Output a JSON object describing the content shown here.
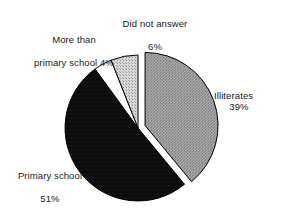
{
  "chart_data": {
    "type": "pie",
    "title": "",
    "subtitle": "",
    "xlabel": "",
    "ylabel": "",
    "legend_position": "none",
    "grid": false,
    "value_suffix": "%",
    "categories": [
      "Illiterates",
      "Primary school",
      "More than primary school",
      "Did not answer"
    ],
    "values": [
      39,
      51,
      4,
      6
    ],
    "slices": [
      {
        "name": "Illiterates",
        "label_line1": "Illiterates",
        "label_line2": "39%",
        "value": 39,
        "value_text": "39%",
        "fill": "#9a9a9a",
        "exploded": true,
        "start_angle_deg": 0,
        "end_angle_deg": 140.4
      },
      {
        "name": "Primary school",
        "label_line1": "Primary school",
        "label_line2": "51%",
        "value": 51,
        "value_text": "51%",
        "fill": "#0d0d0d",
        "exploded": false,
        "start_angle_deg": 140.4,
        "end_angle_deg": 324.0
      },
      {
        "name": "More than primary school",
        "label_line1": "More than",
        "label_line2": "primary school 4%",
        "value": 4,
        "value_text": "4%",
        "fill": "#ffffff",
        "exploded": false,
        "start_angle_deg": 324.0,
        "end_angle_deg": 338.4
      },
      {
        "name": "Did not answer",
        "label_line1": "Did not answer",
        "label_line2": "6%",
        "value": 6,
        "value_text": "6%",
        "fill": "#c4c4c4",
        "exploded": false,
        "start_angle_deg": 338.4,
        "end_angle_deg": 360.0
      }
    ],
    "colors": {
      "illiterates": "#9a9a9a",
      "primary_school": "#0d0d0d",
      "more_than_primary_school": "#ffffff",
      "did_not_answer": "#c4c4c4",
      "outline": "#000000",
      "background": "#ffffff",
      "text": "#1a1a1a"
    }
  },
  "labels": {
    "illiterates": {
      "line1": "Illiterates",
      "line2": "39%"
    },
    "primary_school": {
      "line1": "Primary school",
      "line2": "51%"
    },
    "more_than_primary": {
      "line1": "More than",
      "line2": "primary school 4%"
    },
    "did_not_answer": {
      "line1": "Did not answer",
      "line2": "6%"
    }
  }
}
